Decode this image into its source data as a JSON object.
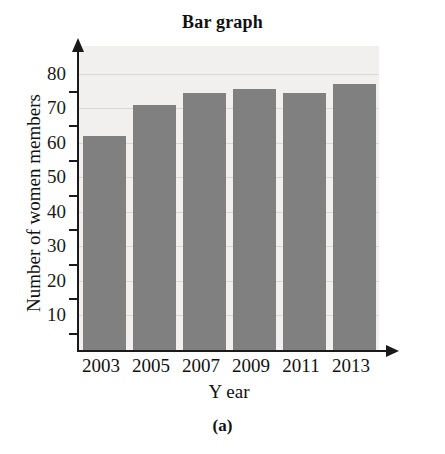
{
  "figure": {
    "title": "Bar graph",
    "caption": "(a)"
  },
  "axes": {
    "x_title": "Year",
    "x_title_lead": "Y",
    "x_title_rest": "ear",
    "y_title": "Number of women members"
  },
  "chart_data": {
    "type": "bar",
    "title": "Bar graph",
    "subtitle": "",
    "xlabel": "Year",
    "ylabel": "Number of women members",
    "categories": [
      "2003",
      "2005",
      "2007",
      "2009",
      "2011",
      "2013"
    ],
    "values": [
      62,
      71,
      74.5,
      75.5,
      74.5,
      77
    ],
    "ylim": [
      0,
      88
    ],
    "ytick_labels": [
      "10",
      "20",
      "30",
      "40",
      "50",
      "60",
      "70",
      "80"
    ],
    "ytick_values": [
      10,
      20,
      30,
      40,
      50,
      60,
      70,
      80
    ],
    "minor_tick_values": [
      5,
      15,
      25,
      35,
      45,
      55,
      65,
      75
    ],
    "grid": true,
    "grid_axis": "y",
    "legend": "none",
    "bar_color": "#808080",
    "panel_color": "#f1f0ee",
    "gridline_color": "#d8d7d3",
    "axis_color": "#1a1a1a"
  }
}
